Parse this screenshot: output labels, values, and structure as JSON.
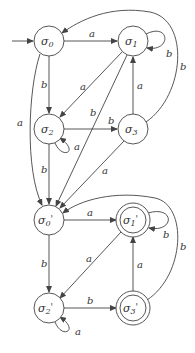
{
  "diagram": {
    "type": "state-transition-automaton",
    "nodes": [
      {
        "id": "s0",
        "label": "σ0",
        "sub": "0",
        "accepting": false,
        "initial": true
      },
      {
        "id": "s1",
        "label": "σ1",
        "sub": "1",
        "accepting": false
      },
      {
        "id": "s2",
        "label": "σ2",
        "sub": "2",
        "accepting": false
      },
      {
        "id": "s3",
        "label": "σ3",
        "sub": "3",
        "accepting": false
      },
      {
        "id": "s0p",
        "label": "σ0'",
        "sub": "0",
        "accepting": false
      },
      {
        "id": "s1p",
        "label": "σ1'",
        "sub": "1",
        "accepting": true
      },
      {
        "id": "s2p",
        "label": "σ2'",
        "sub": "2",
        "accepting": false
      },
      {
        "id": "s3p",
        "label": "σ3'",
        "sub": "3",
        "accepting": true
      }
    ],
    "edges": [
      {
        "from": "s0",
        "to": "s1",
        "label": "a"
      },
      {
        "from": "s0",
        "to": "s2",
        "label": "b"
      },
      {
        "from": "s0",
        "to": "s0p",
        "label": "a"
      },
      {
        "from": "s1",
        "to": "s1",
        "label": "b"
      },
      {
        "from": "s1",
        "to": "s2",
        "label": "a"
      },
      {
        "from": "s1",
        "to": "s0p",
        "label": "b"
      },
      {
        "from": "s2",
        "to": "s3",
        "label": "b"
      },
      {
        "from": "s2",
        "to": "s2",
        "label": "a"
      },
      {
        "from": "s2",
        "to": "s0p",
        "label": "b"
      },
      {
        "from": "s3",
        "to": "s1",
        "label": "a"
      },
      {
        "from": "s3",
        "to": "s0",
        "label": "b"
      },
      {
        "from": "s3",
        "to": "s0p",
        "label": "a"
      },
      {
        "from": "s0p",
        "to": "s1p",
        "label": "a"
      },
      {
        "from": "s0p",
        "to": "s2p",
        "label": "b"
      },
      {
        "from": "s1p",
        "to": "s1p",
        "label": "b"
      },
      {
        "from": "s1p",
        "to": "s2p",
        "label": "a"
      },
      {
        "from": "s2p",
        "to": "s3p",
        "label": "b"
      },
      {
        "from": "s2p",
        "to": "s2p",
        "label": "a"
      },
      {
        "from": "s3p",
        "to": "s1p",
        "label": "a"
      },
      {
        "from": "s3p",
        "to": "s0p",
        "label": "b"
      }
    ],
    "labels": {
      "sigma": "σ",
      "prime": "'",
      "a": "a",
      "b": "b"
    }
  }
}
